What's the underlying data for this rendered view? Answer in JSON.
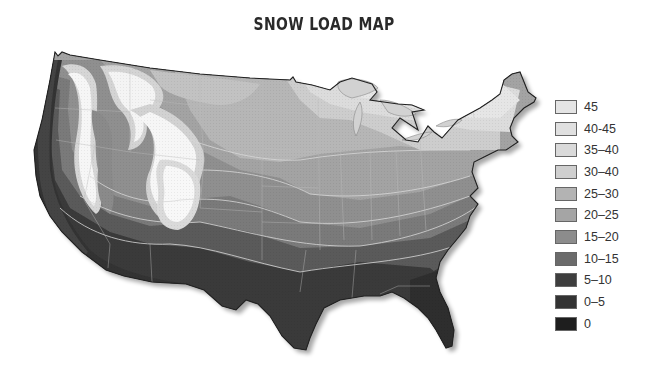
{
  "title": "SNOW LOAD MAP",
  "legend": {
    "items": [
      {
        "label": "45",
        "color": "#e4e4e4"
      },
      {
        "label": "40-45",
        "color": "#e0e0e0"
      },
      {
        "label": "35–40",
        "color": "#dadada"
      },
      {
        "label": "30–40",
        "color": "#cfcfcf"
      },
      {
        "label": "25–30",
        "color": "#b3b3b3"
      },
      {
        "label": "20–25",
        "color": "#a5a5a5"
      },
      {
        "label": "15–20",
        "color": "#8c8c8c"
      },
      {
        "label": "10–15",
        "color": "#6b6b6b"
      },
      {
        "label": "5–10",
        "color": "#3e3e3e"
      },
      {
        "label": "0–5",
        "color": "#333333"
      },
      {
        "label": "0",
        "color": "#1e1e1e"
      }
    ]
  },
  "map": {
    "region": "Contiguous United States",
    "description": "Snow load zones shaded from white/light gray (highest, northern Rockies, Sierra, Great Lakes, New England) to dark gray/black (lowest, Pacific coast, Gulf coast, Florida)"
  }
}
